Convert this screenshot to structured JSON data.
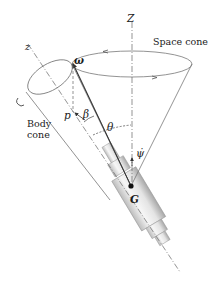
{
  "diagram": {
    "labels": {
      "space_axis": "Z",
      "body_axis": "z",
      "space_cone": "Space cone",
      "body_cone_line1": "Body",
      "body_cone_line2": "cone",
      "angular_velocity": "ω",
      "spin_component": "p",
      "angle_beta": "β",
      "angle_theta": "θ",
      "precession_rate": "ψ̇",
      "center_of_mass": "G"
    },
    "colors": {
      "line": "#555555",
      "dash": "#666666",
      "body_light": "#f2f2f2",
      "body_shade": "#c8c8c8",
      "point": "#111111"
    }
  }
}
